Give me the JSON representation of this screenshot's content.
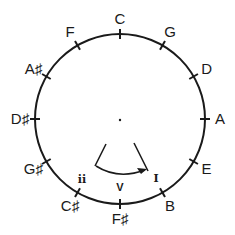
{
  "diagram": {
    "center": [
      120,
      119
    ],
    "radius": 85,
    "notes": [
      {
        "label": "C",
        "angle": 0
      },
      {
        "label": "G",
        "angle": 30
      },
      {
        "label": "D",
        "angle": 60
      },
      {
        "label": "A",
        "angle": 90
      },
      {
        "label": "E",
        "angle": 120
      },
      {
        "label": "B",
        "angle": 150
      },
      {
        "label": "F♯",
        "angle": 180
      },
      {
        "label": "C♯",
        "angle": 210
      },
      {
        "label": "G♯",
        "angle": 240
      },
      {
        "label": "D♯",
        "angle": 270
      },
      {
        "label": "A♯",
        "angle": 300
      },
      {
        "label": "F",
        "angle": 330
      }
    ],
    "progression": {
      "ii": "ii",
      "V": "V",
      "I": "I"
    },
    "colors": {
      "stroke": "#1a1a1a",
      "background": "#ffffff"
    }
  }
}
